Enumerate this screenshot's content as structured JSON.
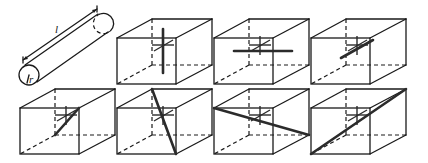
{
  "diagram": {
    "colors": {
      "line": "#1a1a1a",
      "rod": "#2b2b2b",
      "background": "#ffffff"
    },
    "cylinder": {
      "length_label": "l",
      "radius_label": "r"
    },
    "cubes": [
      {
        "id": 1,
        "row": 1,
        "orientation": "vertical"
      },
      {
        "id": 2,
        "row": 1,
        "orientation": "horizontal"
      },
      {
        "id": 3,
        "row": 1,
        "orientation": "depth"
      },
      {
        "id": 4,
        "row": 2,
        "orientation": "side-face-diagonal"
      },
      {
        "id": 5,
        "row": 2,
        "orientation": "front-top-left-to-bottom-diagonal"
      },
      {
        "id": 6,
        "row": 2,
        "orientation": "body-diagonal-down"
      },
      {
        "id": 7,
        "row": 2,
        "orientation": "body-diagonal-up"
      }
    ]
  }
}
